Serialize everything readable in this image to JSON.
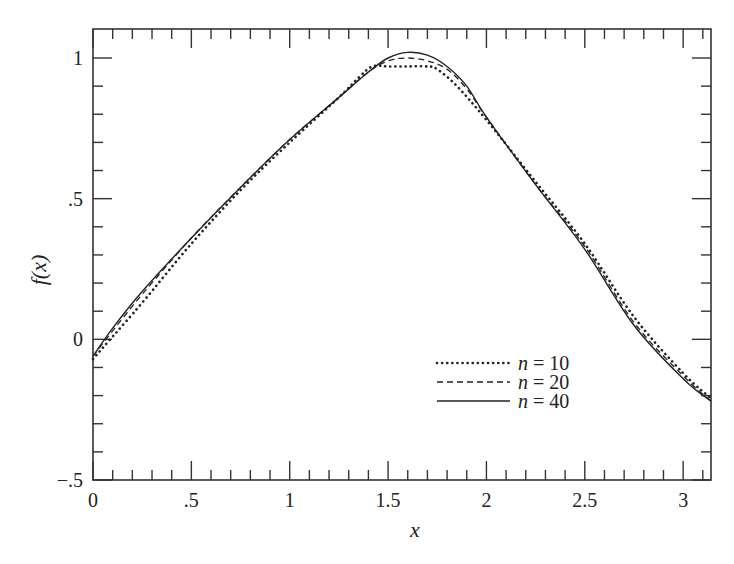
{
  "chart_data": {
    "type": "line",
    "title": "",
    "xlabel": "x",
    "ylabel": "f(x)",
    "xlim": [
      0,
      3.1416
    ],
    "ylim": [
      -0.5,
      1.1
    ],
    "grid": false,
    "legend_position": "lower right (inside)",
    "x_ticks": [
      0,
      0.5,
      1,
      1.5,
      2,
      2.5,
      3
    ],
    "x_tick_labels": [
      "0",
      ".5",
      "1",
      "1.5",
      "2",
      "2.5",
      "3"
    ],
    "y_ticks": [
      -0.5,
      0,
      0.5,
      1
    ],
    "y_tick_labels": [
      "−.5",
      "0",
      ".5",
      "1"
    ],
    "series": [
      {
        "name": "n = 10",
        "style": "dotted",
        "x": [
          0,
          0.1,
          0.25,
          0.5,
          0.75,
          1.0,
          1.25,
          1.35,
          1.42,
          1.5,
          1.6,
          1.7,
          1.75,
          1.85,
          2.0,
          2.25,
          2.5,
          2.75,
          3.0,
          3.1416
        ],
        "y": [
          -0.07,
          0.01,
          0.13,
          0.34,
          0.53,
          0.7,
          0.86,
          0.93,
          0.97,
          0.97,
          0.97,
          0.97,
          0.96,
          0.9,
          0.78,
          0.56,
          0.34,
          0.08,
          -0.12,
          -0.21
        ]
      },
      {
        "name": "n = 20",
        "style": "dashed",
        "x": [
          0,
          0.1,
          0.25,
          0.5,
          0.75,
          1.0,
          1.25,
          1.4,
          1.5,
          1.6,
          1.7,
          1.8,
          1.9,
          2.0,
          2.25,
          2.5,
          2.75,
          3.0,
          3.1416
        ],
        "y": [
          -0.06,
          0.03,
          0.16,
          0.36,
          0.54,
          0.71,
          0.86,
          0.95,
          0.99,
          1.0,
          0.99,
          0.96,
          0.89,
          0.79,
          0.55,
          0.33,
          0.06,
          -0.13,
          -0.22
        ]
      },
      {
        "name": "n = 40",
        "style": "solid",
        "x": [
          0,
          0.1,
          0.25,
          0.5,
          0.75,
          1.0,
          1.25,
          1.4,
          1.5,
          1.6,
          1.7,
          1.8,
          1.9,
          2.0,
          2.25,
          2.5,
          2.75,
          3.0,
          3.1416
        ],
        "y": [
          -0.06,
          0.04,
          0.17,
          0.36,
          0.54,
          0.71,
          0.86,
          0.95,
          1.0,
          1.02,
          1.01,
          0.97,
          0.9,
          0.79,
          0.55,
          0.32,
          0.05,
          -0.14,
          -0.22
        ]
      }
    ]
  },
  "legend": {
    "items": [
      {
        "label": "n = 10",
        "style": "dotted"
      },
      {
        "label": "n = 20",
        "style": "dashed"
      },
      {
        "label": "n = 40",
        "style": "solid"
      }
    ]
  },
  "colors": {
    "line": "#222222",
    "axis": "#333333"
  }
}
